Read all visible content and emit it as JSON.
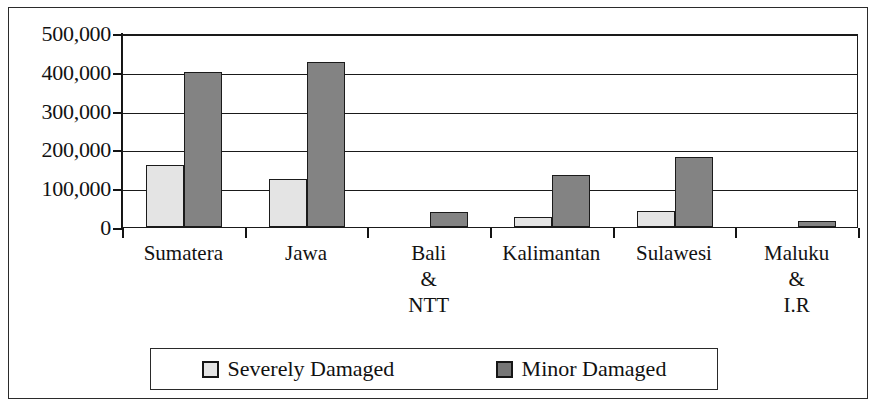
{
  "chart_data": {
    "type": "bar",
    "title": "",
    "subtitle": "",
    "xlabel": "",
    "ylabel": "",
    "categories": [
      "Sumatera",
      "Jawa",
      "Bali\n&\nNTT",
      "Kalimantan",
      "Sulawesi",
      "Maluku\n&\nI.R"
    ],
    "series": [
      {
        "name": "Severely Damaged",
        "color": "#e4e4e4",
        "values": [
          160000,
          125000,
          0,
          25000,
          42000,
          0
        ]
      },
      {
        "name": "Minor Damaged",
        "color": "#838383",
        "values": [
          400000,
          425000,
          38000,
          135000,
          180000,
          15000
        ]
      }
    ],
    "ylim": [
      0,
      500000
    ],
    "ytick_values": [
      0,
      100000,
      200000,
      300000,
      400000,
      500000
    ],
    "ytick_labels": [
      "0",
      "100,000",
      "200,000",
      "300,000",
      "400,000",
      "500,000"
    ],
    "grid": true,
    "legend_position": "bottom"
  },
  "legend": {
    "entries": [
      {
        "label": "Severely Damaged",
        "swatch": "severe"
      },
      {
        "label": "Minor Damaged",
        "swatch": "minor"
      }
    ]
  }
}
